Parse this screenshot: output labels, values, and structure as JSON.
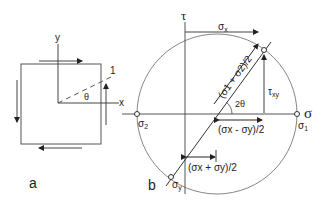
{
  "panel_a": {
    "label": "a",
    "axis_x": "x",
    "axis_y": "y",
    "plane_label": "1",
    "angle": "θ"
  },
  "panel_b": {
    "label": "b",
    "axis_tau": "τ",
    "axis_sigma": "σ",
    "sigma_x": "σ",
    "sigma_x_sub": "x",
    "tau_xy": "τ",
    "tau_xy_sub": "xy",
    "sigma_1": "σ",
    "sigma_1_sub": "1",
    "sigma_2": "σ",
    "sigma_2_sub": "2",
    "sigma_y": "σ",
    "sigma_y_sub": "y",
    "two_theta": "2θ",
    "radius_label": "(σ1 + σ2)/2",
    "half_diff": "(σx - σy)/2",
    "half_sum": "(σx + σy)/2"
  },
  "colors": {
    "line": "#333333",
    "thin": "#777777"
  }
}
